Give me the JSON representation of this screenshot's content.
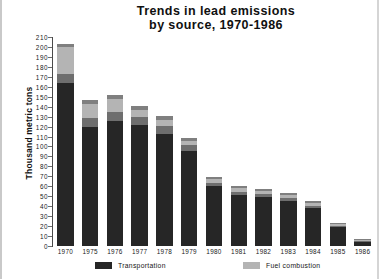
{
  "chart_data": {
    "type": "bar",
    "stacked": true,
    "title": "Trends in lead emissions by source, 1970-1986",
    "title_lines": [
      "Trends in lead emissions",
      "by source, 1970-1986"
    ],
    "xlabel": "",
    "ylabel": "Thousand metric tons",
    "ylim": [
      0,
      210
    ],
    "ytick_step": 10,
    "yticks": [
      0,
      10,
      20,
      30,
      40,
      50,
      60,
      70,
      80,
      90,
      100,
      110,
      120,
      130,
      140,
      150,
      160,
      170,
      180,
      190,
      200,
      210
    ],
    "grid": false,
    "legend_position": "bottom",
    "categories": [
      "1970",
      "1975",
      "1976",
      "1977",
      "1978",
      "1979",
      "1980",
      "1981",
      "1982",
      "1983",
      "1984",
      "1985",
      "1986"
    ],
    "series": [
      {
        "name": "Transportation",
        "color": "#262626",
        "values": [
          164,
          120,
          126,
          122,
          113,
          95,
          60,
          51,
          49,
          45,
          38,
          19,
          4
        ]
      },
      {
        "name": "Other (industrial / solid waste)",
        "color": "#6e6e6e",
        "values": [
          9,
          9,
          9,
          8,
          8,
          6,
          3,
          3,
          3,
          3,
          2,
          1,
          1
        ]
      },
      {
        "name": "Fuel combustion",
        "color": "#b4b4b4",
        "values": [
          27,
          14,
          13,
          7,
          6,
          5,
          4,
          4,
          3,
          3,
          3,
          2,
          1
        ]
      },
      {
        "name": "Smelting",
        "color": "#7f7f7f",
        "values": [
          3,
          4,
          4,
          4,
          4,
          3,
          2,
          2,
          2,
          2,
          2,
          1,
          1
        ]
      }
    ],
    "totals": [
      203,
      147,
      152,
      141,
      131,
      109,
      69,
      60,
      57,
      53,
      45,
      23,
      7
    ],
    "legend_entries": [
      {
        "label": "Transportation",
        "color": "#262626"
      },
      {
        "label": "Fuel combustion",
        "color": "#b4b4b4"
      }
    ]
  },
  "colors": {
    "background": "#ffffff",
    "text": "#111111",
    "axis": "#4a4a4a"
  }
}
